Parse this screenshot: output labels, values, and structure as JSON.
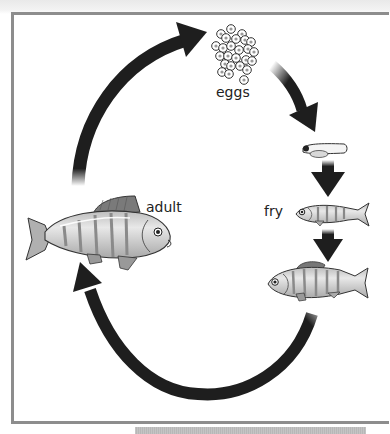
{
  "diagram": {
    "stages": [
      {
        "id": "eggs",
        "label": "eggs"
      },
      {
        "id": "larva",
        "label": ""
      },
      {
        "id": "fry",
        "label": "fry"
      },
      {
        "id": "juvenile",
        "label": ""
      },
      {
        "id": "adult",
        "label": "adult"
      }
    ],
    "flow": [
      "adult",
      "eggs",
      "larva",
      "fry",
      "juvenile",
      "adult"
    ],
    "colors": {
      "arrow": "#1e1e1e",
      "frame_border": "#8d8d8d",
      "fish_body": "#d2d2d2",
      "fish_stripe": "#8a8a8a",
      "text": "#222222"
    }
  }
}
